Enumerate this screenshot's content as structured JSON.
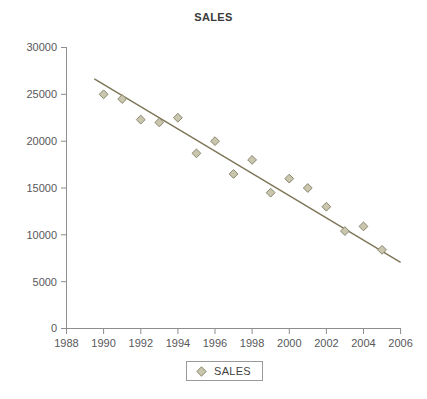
{
  "chart_data": {
    "type": "scatter",
    "title": "SALES",
    "xlabel": "",
    "ylabel": "",
    "xlim": [
      1988,
      2006
    ],
    "ylim": [
      0,
      30000
    ],
    "xticks": [
      1988,
      1990,
      1992,
      1994,
      1996,
      1998,
      2000,
      2002,
      2004,
      2006
    ],
    "yticks": [
      0,
      5000,
      10000,
      15000,
      20000,
      25000,
      30000
    ],
    "grid": false,
    "legend": {
      "position": "bottom-center",
      "entries": [
        {
          "name": "SALES",
          "marker": "diamond",
          "color": "#c9c6ad"
        }
      ]
    },
    "series": [
      {
        "name": "SALES",
        "marker": "diamond",
        "marker_color": "#c9c6ad",
        "marker_edge_color": "#8a8770",
        "x": [
          1990,
          1991,
          1992,
          1993,
          1994,
          1995,
          1996,
          1997,
          1998,
          1999,
          2000,
          2001,
          2002,
          2003,
          2004,
          2005
        ],
        "values": [
          25000,
          24500,
          22300,
          22000,
          22500,
          18700,
          20000,
          16500,
          18000,
          14500,
          16000,
          15000,
          13000,
          10400,
          10900,
          8400
        ]
      }
    ],
    "trendline": {
      "name": "linear-fit",
      "color": "#7d7558",
      "x": [
        1989.5,
        2006.0
      ],
      "y": [
        26650,
        7050
      ]
    },
    "colors": {
      "marker_fill": "#c9c6ad",
      "marker_edge": "#8a8770",
      "trendline": "#7d7558",
      "axis": "#8d8d8f",
      "tick_text": "#58585a",
      "title_text": "#3a3a3a",
      "background": "#ffffff",
      "legend_border": "#9a9a9a"
    }
  },
  "legend": {
    "label": "SALES"
  },
  "axes": {
    "y_labels": [
      "30000",
      "25000",
      "20000",
      "15000",
      "10000",
      "5000",
      "0"
    ],
    "x_labels": [
      "1988",
      "1990",
      "1992",
      "1994",
      "1996",
      "1998",
      "2000",
      "2002",
      "2004",
      "2006"
    ]
  }
}
